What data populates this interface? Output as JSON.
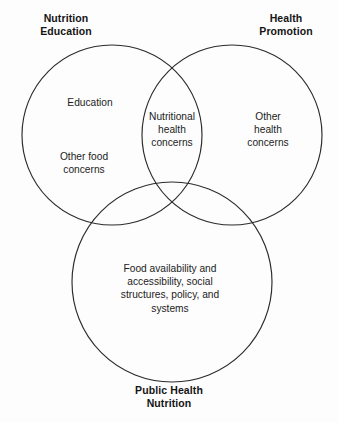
{
  "diagram": {
    "type": "venn",
    "background_color": "#fdfdfd",
    "stroke_color": "#2b2b2b",
    "outer_labels": {
      "top_left": "Nutrition\nEducation",
      "top_right": "Health\nPromotion",
      "bottom": "Public Health\nNutrition"
    },
    "sets": [
      {
        "id": "nutrition-education",
        "label": "Nutrition Education",
        "position": "top-left",
        "center_x": 112,
        "center_y": 135,
        "radius": 90
      },
      {
        "id": "health-promotion",
        "label": "Health Promotion",
        "position": "top-right",
        "center_x": 232,
        "center_y": 135,
        "radius": 90
      },
      {
        "id": "public-health-nutrition",
        "label": "Public Health Nutrition",
        "position": "bottom",
        "center_x": 172,
        "center_y": 282,
        "radius": 100
      }
    ],
    "regions": [
      {
        "id": "education",
        "belongs_to": "nutrition-education",
        "text": "Education"
      },
      {
        "id": "other-food-concerns",
        "belongs_to": "nutrition-education",
        "text": "Other food\nconcerns"
      },
      {
        "id": "nutritional-health-concerns",
        "belongs_to": "nutrition-education ∩ health-promotion",
        "text": "Nutritional\nhealth\nconcerns"
      },
      {
        "id": "other-health-concerns",
        "belongs_to": "health-promotion",
        "text": "Other\nhealth\nconcerns"
      },
      {
        "id": "food-availability",
        "belongs_to": "public-health-nutrition",
        "text": "Food availability and\naccessibility, social\nstructures, policy, and\nsystems"
      }
    ]
  }
}
